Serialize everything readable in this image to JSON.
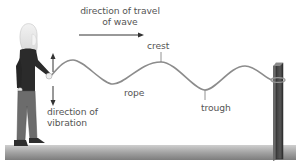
{
  "diagram": {
    "type": "transverse wave on a rope",
    "labels": {
      "travel_line1": "direction of travel",
      "travel_line2": "of wave",
      "crest": "crest",
      "rope": "rope",
      "trough": "trough",
      "vibration_line1": "direction of",
      "vibration_line2": "vibration"
    },
    "colors": {
      "background": "#ffffff",
      "text": "#555555",
      "rope": "#8a8a8a",
      "arrow": "#333333",
      "ground_top": "#c8c8c8",
      "ground_bottom": "#7a7a7a",
      "post": "#4a4a4a",
      "person_top": "#2b2b2b",
      "person_trousers": "#6e6e6e",
      "hair": "#e6e6e6"
    },
    "elements": [
      {
        "name": "person",
        "role": "shakes rope end up and down"
      },
      {
        "name": "rope",
        "role": "carries wave"
      },
      {
        "name": "post",
        "role": "fixed end of rope"
      },
      {
        "name": "ground"
      }
    ]
  }
}
